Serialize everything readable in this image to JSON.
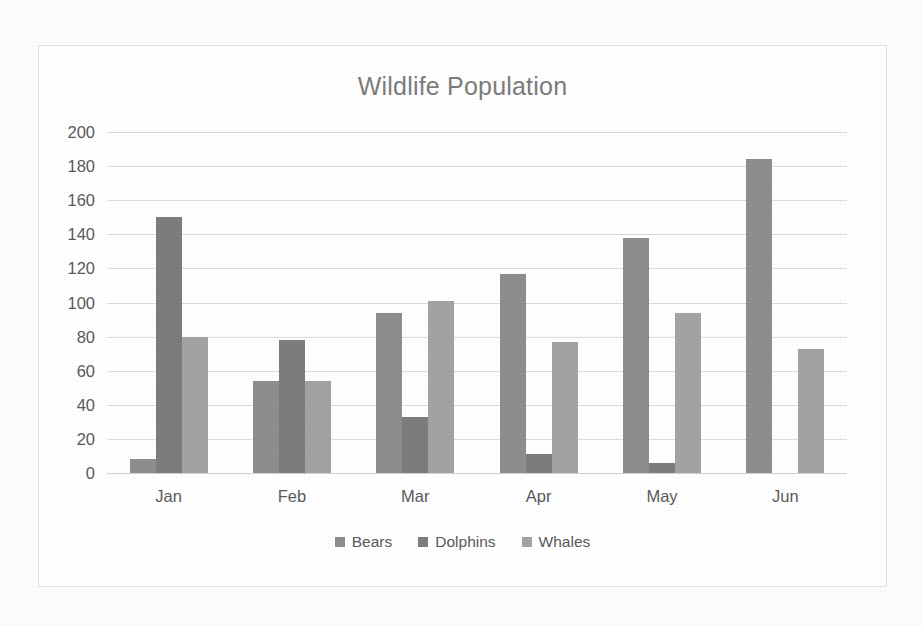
{
  "chart_data": {
    "type": "bar",
    "title": "Wildlife Population",
    "xlabel": "",
    "ylabel": "",
    "categories": [
      "Jan",
      "Feb",
      "Mar",
      "Apr",
      "May",
      "Jun"
    ],
    "series": [
      {
        "name": "Bears",
        "values": [
          8,
          54,
          94,
          117,
          138,
          184
        ],
        "color": "#8e8e8e"
      },
      {
        "name": "Dolphins",
        "values": [
          150,
          78,
          33,
          11,
          6,
          0
        ],
        "color": "#7d7d7d"
      },
      {
        "name": "Whales",
        "values": [
          80,
          54,
          101,
          77,
          94,
          73
        ],
        "color": "#a3a3a3"
      }
    ],
    "ylim": [
      0,
      200
    ],
    "ytick_step": 20,
    "yticks": [
      200,
      180,
      160,
      140,
      120,
      100,
      80,
      60,
      40,
      20,
      0
    ],
    "grid": true,
    "legend_position": "bottom"
  },
  "colors": {
    "background": "#fdfdfc",
    "plot_background": "#ffffff",
    "frame_border": "#e2e2e2",
    "gridline": "#dcdcdc",
    "title_text": "#7c7c7c",
    "tick_text": "#5a5a5a"
  }
}
